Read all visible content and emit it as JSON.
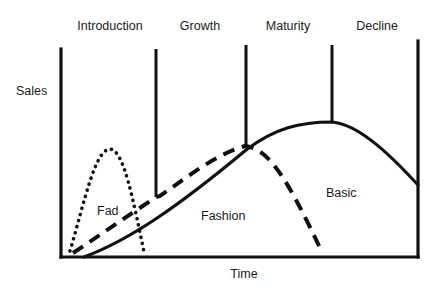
{
  "diagram": {
    "stages": [
      {
        "label": "Introduction",
        "x": 110
      },
      {
        "label": "Growth",
        "x": 200
      },
      {
        "label": "Maturity",
        "x": 288
      },
      {
        "label": "Decline",
        "x": 376
      }
    ],
    "axes": {
      "y_label": "Sales",
      "x_label": "Time"
    },
    "curves": [
      {
        "name": "Fad",
        "style": "dotted",
        "label": "Fad"
      },
      {
        "name": "Fashion",
        "style": "dashed",
        "label": "Fashion"
      },
      {
        "name": "Basic",
        "style": "solid",
        "label": "Basic"
      }
    ],
    "colors": {
      "line": "#111111",
      "background": "#ffffff",
      "text": "#1a1a1a"
    }
  }
}
